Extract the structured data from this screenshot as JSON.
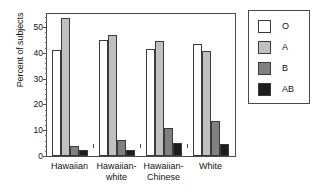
{
  "chart_data": {
    "type": "bar",
    "title": "",
    "xlabel": "",
    "ylabel": "Percent of subjects",
    "ylim": [
      0,
      55
    ],
    "yticks": [
      0,
      10,
      20,
      30,
      40,
      50
    ],
    "ytick_labels": [
      "0",
      "10",
      "20",
      "30",
      "40",
      "50"
    ],
    "grid": false,
    "legend_position": "right-outside",
    "categories": [
      "Hawaiian",
      "Hawaiian-\nwhite",
      "Hawaiian-\nChinese",
      "White"
    ],
    "category_labels_flat": [
      "Hawaiian",
      "Hawaiian-white",
      "Hawaiian-Chinese",
      "White"
    ],
    "series": [
      {
        "name": "O",
        "color": "#ffffff",
        "values": [
          41.0,
          45.0,
          41.5,
          43.5
        ]
      },
      {
        "name": "A",
        "color": "#c0c0c0",
        "values": [
          53.5,
          47.0,
          44.5,
          40.5
        ]
      },
      {
        "name": "B",
        "color": "#808080",
        "values": [
          4.0,
          6.2,
          11.0,
          13.5
        ]
      },
      {
        "name": "AB",
        "color": "#1c1c1c",
        "values": [
          2.2,
          2.5,
          5.0,
          4.5
        ]
      }
    ]
  },
  "legend": {
    "items": [
      {
        "label": "O",
        "color": "#ffffff"
      },
      {
        "label": "A",
        "color": "#c0c0c0"
      },
      {
        "label": "B",
        "color": "#808080"
      },
      {
        "label": "AB",
        "color": "#1c1c1c"
      }
    ]
  }
}
